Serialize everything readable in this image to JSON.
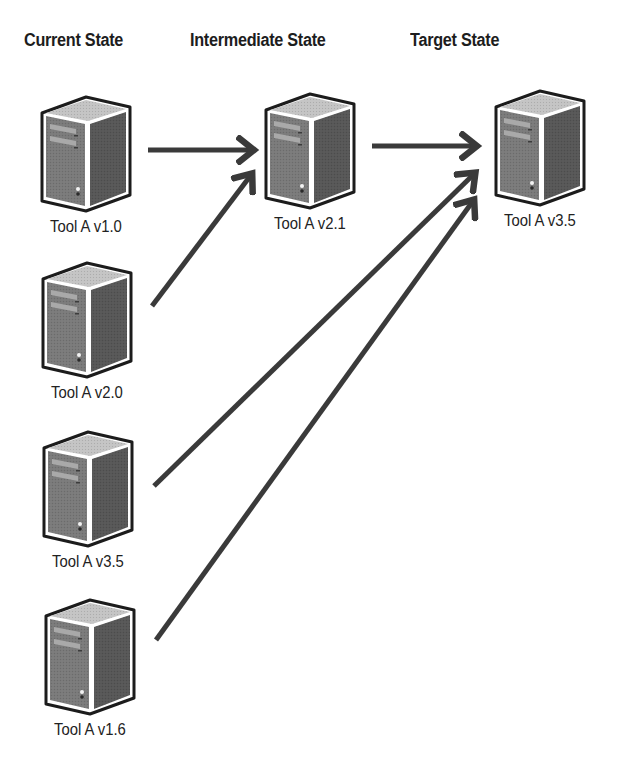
{
  "diagram": {
    "headers": {
      "current": "Current State",
      "intermediate": "Intermediate State",
      "target": "Target State"
    },
    "nodes": {
      "current": [
        {
          "label": "Tool A v1.0",
          "icon": "server-tower-icon"
        },
        {
          "label": "Tool A v2.0",
          "icon": "server-tower-icon"
        },
        {
          "label": "Tool A v3.5",
          "icon": "server-tower-icon"
        },
        {
          "label": "Tool A v1.6",
          "icon": "server-tower-icon"
        }
      ],
      "intermediate": [
        {
          "label": "Tool A v2.1",
          "icon": "server-tower-icon"
        }
      ],
      "target": [
        {
          "label": "Tool A v3.5",
          "icon": "server-tower-icon"
        }
      ]
    },
    "edges": [
      {
        "from": "Tool A v1.0",
        "to": "Tool A v2.1"
      },
      {
        "from": "Tool A v2.0",
        "to": "Tool A v2.1"
      },
      {
        "from": "Tool A v2.1",
        "to": "Tool A v3.5 (Target)"
      },
      {
        "from": "Tool A v3.5",
        "to": "Tool A v3.5 (Target)"
      },
      {
        "from": "Tool A v1.6",
        "to": "Tool A v3.5 (Target)"
      }
    ],
    "colors": {
      "arrow": "#3a3a3a",
      "outline": "#1c1c1c",
      "server_top": "#c4c4c4",
      "server_front": "#7a7a7a",
      "server_side": "#565656",
      "drive_bay": "#a8a8a8",
      "background": "#ffffff"
    }
  }
}
